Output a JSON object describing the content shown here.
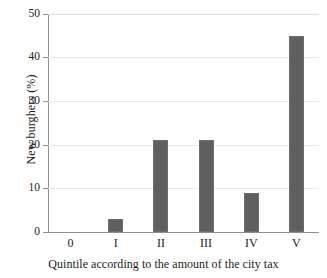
{
  "chart_data": {
    "type": "bar",
    "title": "",
    "subtitle": "",
    "categories": [
      "0",
      "I",
      "II",
      "III",
      "IV",
      "V"
    ],
    "values": [
      0,
      3,
      21,
      21,
      9,
      45
    ],
    "xlabel": "Quintile according to the amount of the city tax",
    "ylabel": "New burghers (%)",
    "ylim": [
      0,
      50
    ],
    "ytick_labels": [
      "50",
      "40",
      "30",
      "20",
      "10",
      "0"
    ],
    "ytick_values": [
      50,
      40,
      30,
      20,
      10,
      0
    ],
    "grid": true,
    "grid_axis": "y",
    "legend": false,
    "legend_position": "none",
    "bar_color": "#5f5f5f",
    "grid_color": "#e9e9e9",
    "axis_color": "#8f8f8f",
    "background_color": "#ffffff"
  }
}
